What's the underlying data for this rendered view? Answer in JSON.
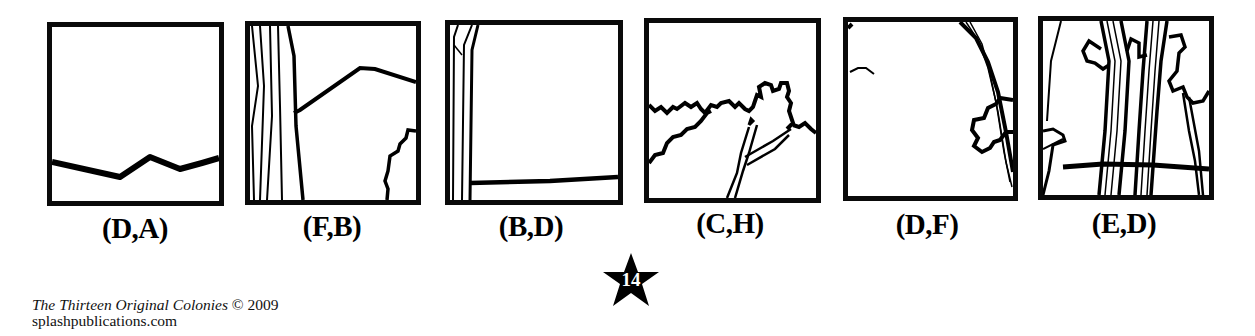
{
  "puzzle": {
    "panels": [
      {
        "id": 1,
        "coordinate": "(D,A)",
        "illustration": "horizon-line"
      },
      {
        "id": 2,
        "coordinate": "(F,B)",
        "illustration": "tree-trunk-and-hill"
      },
      {
        "id": 3,
        "coordinate": "(B,D)",
        "illustration": "trunk-and-ground-line"
      },
      {
        "id": 4,
        "coordinate": "(C,H)",
        "illustration": "tree-canopy-branches"
      },
      {
        "id": 5,
        "coordinate": "(D,F)",
        "illustration": "curved-trunk-and-foliage"
      },
      {
        "id": 6,
        "coordinate": "(E,D)",
        "illustration": "tree-trunks-and-foliage"
      }
    ]
  },
  "footer": {
    "book_title": "The Thirteen Original Colonies",
    "copyright": "© 2009",
    "website": "splashpublications.com"
  },
  "page": {
    "number": "14",
    "badge_shape": "star-icon",
    "badge_color": "#000000"
  }
}
